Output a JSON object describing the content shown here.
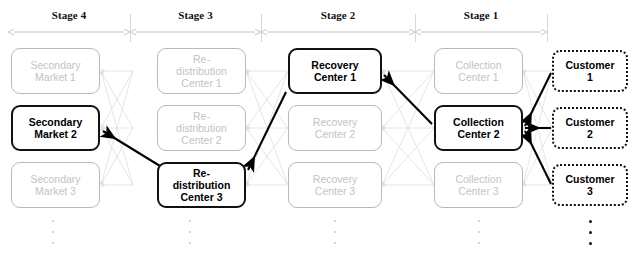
{
  "diagram": {
    "type": "network-flow-diagram",
    "colors": {
      "highlight": "#111111",
      "dimmed": "#c3c3c3",
      "dimmed_border": "#b9b9b9",
      "mesh_edge": "#dcdcdc",
      "background": "#ffffff"
    }
  },
  "stages": [
    {
      "label": "Stage 4",
      "x_start": 11,
      "x_end": 127
    },
    {
      "label": "Stage 3",
      "x_start": 133,
      "x_end": 258
    },
    {
      "label": "Stage 2",
      "x_start": 264,
      "x_end": 412
    },
    {
      "label": "Stage 1",
      "x_start": 418,
      "x_end": 544
    }
  ],
  "columns": [
    {
      "name": "secondary-market",
      "stage": "Stage 4",
      "nodes": [
        {
          "label": "Secondary\nMarket 1",
          "line1": "Secondary",
          "line2": "Market 1",
          "state": "dimmed"
        },
        {
          "label": "Secondary\nMarket 2",
          "line1": "Secondary",
          "line2": "Market 2",
          "state": "highlighted"
        },
        {
          "label": "Secondary\nMarket 3",
          "line1": "Secondary",
          "line2": "Market 3",
          "state": "dimmed"
        }
      ],
      "ellipsis": "dimmed"
    },
    {
      "name": "redistribution-center",
      "stage": "Stage 3",
      "nodes": [
        {
          "label": "Re-\ndistribution\nCenter 1",
          "line1": "Re-",
          "line2": "distribution",
          "line3": "Center 1",
          "state": "dimmed"
        },
        {
          "label": "Re-\ndistribution\nCenter 2",
          "line1": "Re-",
          "line2": "distribution",
          "line3": "Center 2",
          "state": "dimmed"
        },
        {
          "label": "Re-\ndistribution\nCenter 3",
          "line1": "Re-",
          "line2": "distribution",
          "line3": "Center 3",
          "state": "highlighted"
        }
      ],
      "ellipsis": "dimmed"
    },
    {
      "name": "recovery-center",
      "stage": "Stage 2",
      "nodes": [
        {
          "label": "Recovery\nCenter 1",
          "line1": "Recovery",
          "line2": "Center 1",
          "state": "highlighted"
        },
        {
          "label": "Recovery\nCenter 2",
          "line1": "Recovery",
          "line2": "Center 2",
          "state": "dimmed"
        },
        {
          "label": "Recovery\nCenter 3",
          "line1": "Recovery",
          "line2": "Center 3",
          "state": "dimmed"
        }
      ],
      "ellipsis": "dimmed"
    },
    {
      "name": "collection-center",
      "stage": "Stage 1",
      "nodes": [
        {
          "label": "Collection\nCenter 1",
          "line1": "Collection",
          "line2": "Center 1",
          "state": "dimmed"
        },
        {
          "label": "Collection\nCenter 2",
          "line1": "Collection",
          "line2": "Center 2",
          "state": "highlighted"
        },
        {
          "label": "Collection\nCenter 3",
          "line1": "Collection",
          "line2": "Center 3",
          "state": "dimmed"
        }
      ],
      "ellipsis": "dimmed"
    },
    {
      "name": "customer",
      "stage": "",
      "nodes": [
        {
          "label": "Customer\n1",
          "line1": "Customer",
          "line2": "1",
          "state": "customer"
        },
        {
          "label": "Customer\n2",
          "line1": "Customer",
          "line2": "2",
          "state": "customer"
        },
        {
          "label": "Customer\n3",
          "line1": "Customer",
          "line2": "3",
          "state": "customer"
        }
      ],
      "ellipsis": "dark"
    }
  ],
  "highlighted_path": [
    {
      "from": "Customer 1",
      "to": "Collection Center 2"
    },
    {
      "from": "Customer 2",
      "to": "Collection Center 2"
    },
    {
      "from": "Customer 3",
      "to": "Collection Center 2"
    },
    {
      "from": "Collection Center 2",
      "to": "Recovery Center 1"
    },
    {
      "from": "Recovery Center 1",
      "to": "Re-distribution Center 3"
    },
    {
      "from": "Re-distribution Center 3",
      "to": "Secondary Market 2"
    }
  ]
}
